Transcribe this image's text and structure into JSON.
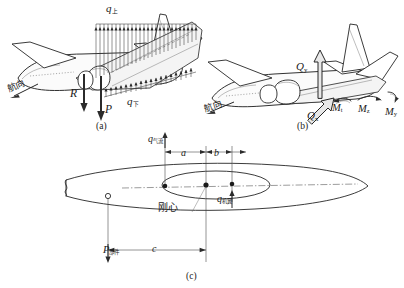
{
  "figure": {
    "panels": [
      {
        "id": "a",
        "caption": "(a)",
        "description": "机翼气动压力分布与部件集中载荷",
        "labels": {
          "q_upper": "q",
          "q_upper_sub": "上",
          "q_lower": "q",
          "q_lower_sub": "下",
          "force_R": "R",
          "force_P": "P",
          "heading": "航向"
        }
      },
      {
        "id": "b",
        "caption": "(b)",
        "description": "剖面剪力与力矩分量",
        "labels": {
          "Q_y": "Q",
          "Q_y_sub": "y",
          "Q_x": "Q",
          "Q_x_sub": "x",
          "M_t": "M",
          "M_t_sub": "t",
          "M_z": "M",
          "M_z_sub": "z",
          "M_y": "M",
          "M_y_sub": "y",
          "heading": "航向"
        }
      },
      {
        "id": "c",
        "caption": "(c)",
        "description": "机翼剖面刚心与载荷作用点距离",
        "labels": {
          "q_airflow": "q",
          "q_airflow_sub": "气流",
          "q_wing": "q",
          "q_wing_sub": "机翼",
          "shear_center": "刚心",
          "P_component": "P",
          "P_component_sub": "部件",
          "dim_a": "a",
          "dim_b": "b",
          "dim_c": "c"
        }
      }
    ]
  },
  "colors": {
    "ink": "#262626",
    "hairline": "#5a5a5a",
    "paper": "#ffffff"
  }
}
